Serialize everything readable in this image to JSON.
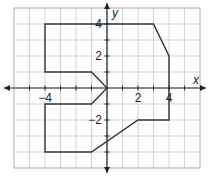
{
  "diagram": {
    "type": "coordinate-plane-figure",
    "axes": {
      "x_label": "x",
      "y_label": "y",
      "x_range": [
        -6,
        6
      ],
      "y_range": [
        -5,
        5
      ],
      "x_tick_labels": [
        {
          "value": -4,
          "text": "−4"
        },
        {
          "value": 2,
          "text": "2"
        },
        {
          "value": 4,
          "text": "4"
        }
      ],
      "y_tick_labels": [
        {
          "value": 4,
          "text": "4"
        },
        {
          "value": 2,
          "text": "2"
        },
        {
          "value": -2,
          "text": "−2"
        }
      ]
    },
    "grid": {
      "on": true,
      "step": 1,
      "color": "#c8c8c8"
    },
    "shape": {
      "name": "polygon",
      "stroke": "#333333",
      "vertices": [
        [
          -4,
          4
        ],
        [
          3,
          4
        ],
        [
          4,
          2
        ],
        [
          4,
          -2
        ],
        [
          2,
          -2
        ],
        [
          -1,
          -4
        ],
        [
          -4,
          -4
        ],
        [
          -4,
          -1
        ],
        [
          -1,
          -1
        ],
        [
          0,
          0
        ],
        [
          -1,
          1
        ],
        [
          -4,
          1
        ]
      ]
    }
  }
}
